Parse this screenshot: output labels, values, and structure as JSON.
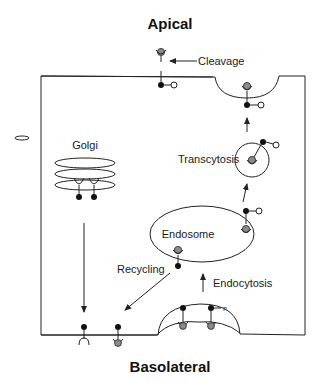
{
  "diagram": {
    "labels": {
      "apical": "Apical",
      "basolateral": "Basolateral",
      "cleavage": "Cleavage",
      "golgi": "Golgi",
      "transcytosis": "Transcytosis",
      "endosome": "Endosome",
      "recycling": "Recycling",
      "endocytosis": "Endocytosis",
      "phospho_small": "P",
      "phospho_circle": "P"
    },
    "colors": {
      "line": "#222222",
      "ligand_fill": "#8a8a8a",
      "receptor_fill": "#111111",
      "background": "#ffffff"
    }
  }
}
